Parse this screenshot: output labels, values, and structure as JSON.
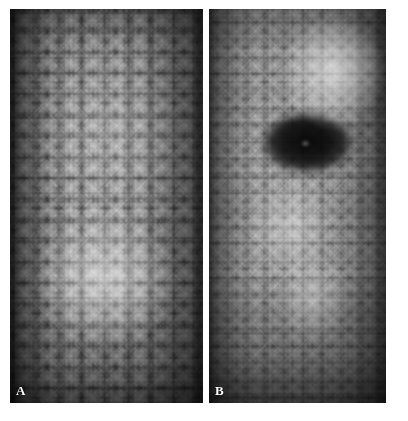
{
  "figure": {
    "background_color": "#ffffff",
    "width": 408,
    "height": 421,
    "caption": "",
    "modality": "grayscale reflectance micrograph",
    "panel_count": 2
  },
  "panels": [
    {
      "id": "A",
      "label": "A",
      "label_color": "#ffffff",
      "x": 10,
      "y": 9,
      "width": 193,
      "height": 394,
      "description": "Uniform honeycomb mosaic of bright polygonal cells with dark intercellular borders; bright illumination band through the lower-centre, dark vignetting at left and right edges.",
      "texture": "polygonal-cell-mosaic",
      "mean_tone": "#8d8d8d",
      "cell_size_px": 21,
      "sharpness": "sharp",
      "lesion_present": false
    },
    {
      "id": "B",
      "label": "B",
      "label_color": "#ffffff",
      "x": 209,
      "y": 9,
      "width": 177,
      "height": 394,
      "description": "Similar cellular mosaic but smaller, blurrier and lower contrast, with a large dark elliptical hypo-reflective lesion in the upper third and a bright highlight at upper right.",
      "texture": "polygonal-cell-mosaic",
      "mean_tone": "#858585",
      "cell_size_px": 17,
      "sharpness": "blurred",
      "lesion_present": true,
      "lesion": {
        "name": "dark-elliptical-lesion",
        "center_x": 307,
        "center_y": 143,
        "width": 80,
        "height": 54,
        "tone": "#151515",
        "shape": "ellipse"
      }
    }
  ],
  "separator": {
    "name": "panel-separator",
    "x": 203,
    "width": 6,
    "color": "#ffffff"
  },
  "colors": {
    "page_background": "#ffffff",
    "panel_base_a": "#8d8d8d",
    "panel_base_b": "#858585",
    "label_text": "#ffffff",
    "lesion_dark": "#151515",
    "vignette_dark": "#000000"
  }
}
